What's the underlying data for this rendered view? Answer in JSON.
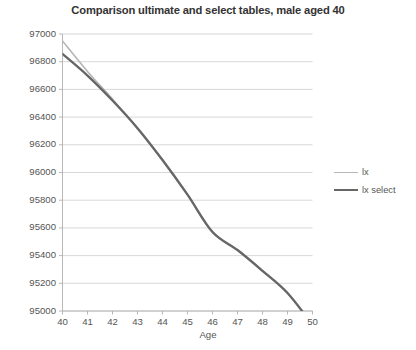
{
  "chart_data": {
    "type": "line",
    "title": "Comparison ultimate and select tables, male aged 40",
    "xlabel": "Age",
    "ylabel": "",
    "xlim": [
      40,
      50
    ],
    "ylim": [
      95000,
      97000
    ],
    "grid": true,
    "legend_position": "right",
    "x_ticks": [
      "40",
      "41",
      "42",
      "43",
      "44",
      "45",
      "46",
      "47",
      "48",
      "49",
      "50"
    ],
    "y_ticks": [
      "95000",
      "95200",
      "95400",
      "95600",
      "95800",
      "96000",
      "96200",
      "96400",
      "96600",
      "96800",
      "97000"
    ],
    "x": [
      40,
      41,
      42,
      43,
      44,
      45,
      46,
      47,
      48,
      49,
      50
    ],
    "series": [
      {
        "name": "lx",
        "color": "#b6b6b6",
        "width": 1.6,
        "values": [
          96950,
          96730,
          96530,
          96320,
          96090,
          95840,
          95570,
          95440,
          95290,
          95130,
          94900
        ]
      },
      {
        "name": "lx select",
        "color": "#676767",
        "width": 2.4,
        "values": [
          96856,
          96700,
          96520,
          96320,
          96090,
          95840,
          95570,
          95440,
          95290,
          95130,
          94900
        ]
      }
    ]
  },
  "legend": {
    "items": [
      {
        "label": "lx"
      },
      {
        "label": "lx select"
      }
    ]
  },
  "axes": {
    "x_title": "Age"
  }
}
